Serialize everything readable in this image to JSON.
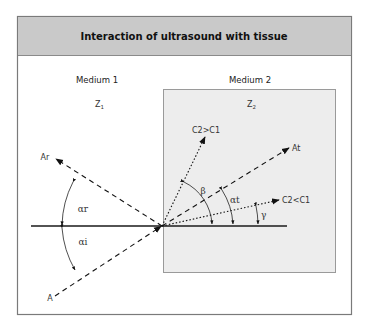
{
  "figure": {
    "title": "Interaction of ultrasound with tissue",
    "media": [
      {
        "name": "Medium 1",
        "impedance_label": "Z",
        "impedance_sub": "1"
      },
      {
        "name": "Medium 2",
        "impedance_label": "Z",
        "impedance_sub": "2"
      }
    ],
    "rays": {
      "incident": "A",
      "reflected": "Ar",
      "transmitted": "At",
      "faster_medium": "C2>C1",
      "slower_medium": "C2<C1"
    },
    "angles": {
      "reflection": "αr",
      "incidence": "αi",
      "transmission": "αt",
      "beta": "β",
      "gamma": "γ"
    },
    "colors": {
      "header_fill": "#c9c9c9",
      "medium2_fill": "#ededed",
      "frame": "#7a7a7a",
      "line": "#1a1a1a"
    }
  }
}
